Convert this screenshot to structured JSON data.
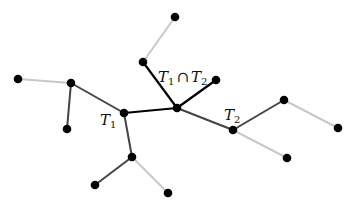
{
  "diagram": {
    "colors": {
      "intersection_edge": "#000000",
      "tree_edge": "#444444",
      "other_edge": "#c8c8c8",
      "node": "#000000",
      "background": "#ffffff"
    },
    "nodes": [
      {
        "id": "A",
        "x": 175,
        "y": 17
      },
      {
        "id": "B",
        "x": 143,
        "y": 62
      },
      {
        "id": "C",
        "x": 216,
        "y": 80
      },
      {
        "id": "D",
        "x": 177,
        "y": 108
      },
      {
        "id": "E",
        "x": 124,
        "y": 113
      },
      {
        "id": "F",
        "x": 71,
        "y": 83
      },
      {
        "id": "G",
        "x": 18,
        "y": 79
      },
      {
        "id": "H",
        "x": 67,
        "y": 129
      },
      {
        "id": "I",
        "x": 132,
        "y": 157
      },
      {
        "id": "J",
        "x": 95,
        "y": 185
      },
      {
        "id": "K",
        "x": 168,
        "y": 193
      },
      {
        "id": "L",
        "x": 233,
        "y": 130
      },
      {
        "id": "M",
        "x": 284,
        "y": 100
      },
      {
        "id": "N",
        "x": 338,
        "y": 128
      },
      {
        "id": "O",
        "x": 287,
        "y": 158
      }
    ],
    "edges": [
      {
        "from": "A",
        "to": "B",
        "kind": "other"
      },
      {
        "from": "B",
        "to": "D",
        "kind": "intersection"
      },
      {
        "from": "D",
        "to": "C",
        "kind": "intersection"
      },
      {
        "from": "D",
        "to": "E",
        "kind": "intersection"
      },
      {
        "from": "E",
        "to": "F",
        "kind": "tree"
      },
      {
        "from": "F",
        "to": "G",
        "kind": "other"
      },
      {
        "from": "F",
        "to": "H",
        "kind": "tree"
      },
      {
        "from": "E",
        "to": "I",
        "kind": "tree"
      },
      {
        "from": "I",
        "to": "J",
        "kind": "tree"
      },
      {
        "from": "I",
        "to": "K",
        "kind": "other"
      },
      {
        "from": "D",
        "to": "L",
        "kind": "tree"
      },
      {
        "from": "L",
        "to": "M",
        "kind": "tree"
      },
      {
        "from": "M",
        "to": "N",
        "kind": "other"
      },
      {
        "from": "L",
        "to": "O",
        "kind": "other"
      }
    ],
    "labels": {
      "t1": {
        "letter": "T",
        "sub": "1"
      },
      "t2": {
        "letter": "T",
        "sub": "2"
      },
      "intersection": {
        "left_letter": "T",
        "left_sub": "1",
        "op": "∩",
        "right_letter": "T",
        "right_sub": "2"
      }
    }
  }
}
